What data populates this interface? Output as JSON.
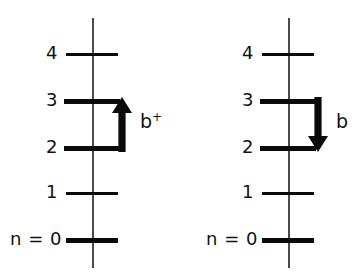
{
  "figure": {
    "background_color": "#ffffff",
    "ink_color": "#0a0a0a",
    "axis_color": "#4a4a4a",
    "width": 361,
    "height": 272
  },
  "panels": [
    {
      "id": "left",
      "axis_x": 92,
      "levels": [
        {
          "label": "4",
          "y": 54,
          "weight": "thin",
          "line_x": 66,
          "line_w": 52,
          "label_x": 22,
          "label_w": 36
        },
        {
          "label": "3",
          "y": 101,
          "weight": "thick",
          "line_x": 64,
          "line_w": 56,
          "label_x": 22,
          "label_w": 36
        },
        {
          "label": "2",
          "y": 148,
          "weight": "thick",
          "line_x": 64,
          "line_w": 56,
          "label_x": 22,
          "label_w": 36
        },
        {
          "label": "1",
          "y": 193,
          "weight": "thin",
          "line_x": 66,
          "line_w": 52,
          "label_x": 22,
          "label_w": 36
        },
        {
          "label": "n = 0",
          "y": 240,
          "weight": "thick",
          "line_x": 66,
          "line_w": 52,
          "label_x": 10,
          "label_w": 48
        }
      ],
      "arrow": {
        "direction": "up",
        "name": "creation-arrow",
        "x": 112,
        "y": 97,
        "w": 20,
        "h": 55,
        "from_level": "2",
        "to_level": "3"
      },
      "operator": {
        "base": "b",
        "superscript": "+",
        "x": 140,
        "y": 112,
        "meaning": "creation-operator"
      }
    },
    {
      "id": "right",
      "axis_x": 107,
      "levels": [
        {
          "label": "4",
          "y": 54,
          "weight": "thin",
          "line_x": 81,
          "line_w": 52,
          "label_x": 37,
          "label_w": 36
        },
        {
          "label": "3",
          "y": 101,
          "weight": "thick",
          "line_x": 79,
          "line_w": 56,
          "label_x": 37,
          "label_w": 36
        },
        {
          "label": "2",
          "y": 148,
          "weight": "thick",
          "line_x": 79,
          "line_w": 56,
          "label_x": 37,
          "label_w": 36
        },
        {
          "label": "1",
          "y": 193,
          "weight": "thin",
          "line_x": 81,
          "line_w": 52,
          "label_x": 37,
          "label_w": 36
        },
        {
          "label": "n = 0",
          "y": 240,
          "weight": "thick",
          "line_x": 81,
          "line_w": 52,
          "label_x": 25,
          "label_w": 48
        }
      ],
      "arrow": {
        "direction": "down",
        "name": "annihilation-arrow",
        "x": 127,
        "y": 97,
        "w": 20,
        "h": 55,
        "from_level": "3",
        "to_level": "2"
      },
      "operator": {
        "base": "b",
        "superscript": "",
        "x": 155,
        "y": 112,
        "meaning": "annihilation-operator"
      }
    }
  ]
}
